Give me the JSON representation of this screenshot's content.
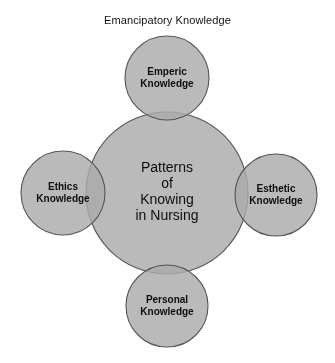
{
  "figure": {
    "caption": "Emancipatory Knowledge",
    "center": {
      "lines": [
        "Patterns",
        "of",
        "Knowing",
        "in Nursing"
      ],
      "text": "Patterns\nof\nKnowing\nin Nursing"
    },
    "nodes": [
      {
        "id": "emperic",
        "position": "top",
        "lines": [
          "Emperic",
          "Knowledge"
        ],
        "text": "Emperic\nKnowledge"
      },
      {
        "id": "ethics",
        "position": "left",
        "lines": [
          "Ethics",
          "Knowledge"
        ],
        "text": "Ethics\nKnowledge"
      },
      {
        "id": "esthetic",
        "position": "right",
        "lines": [
          "Esthetic",
          "Knowledge"
        ],
        "text": "Esthetic\nKnowledge"
      },
      {
        "id": "personal",
        "position": "bottom",
        "lines": [
          "Personal",
          "Knowledge"
        ],
        "text": "Personal\nKnowledge"
      }
    ]
  },
  "chart_data": {
    "type": "diagram",
    "subtype": "venn-overlap",
    "title": "Emancipatory Knowledge",
    "center_node": {
      "label": "Patterns of Knowing in Nursing",
      "cx": 167,
      "cy": 193,
      "r": 81
    },
    "satellite_nodes": [
      {
        "label": "Emperic Knowledge",
        "cx": 167,
        "cy": 78,
        "r": 42
      },
      {
        "label": "Ethics Knowledge",
        "cx": 63,
        "cy": 193,
        "r": 42
      },
      {
        "label": "Esthetic Knowledge",
        "cx": 276,
        "cy": 195,
        "r": 41
      },
      {
        "label": "Personal Knowledge",
        "cx": 167,
        "cy": 306,
        "r": 41
      }
    ],
    "colors": {
      "fill": "#ababab",
      "overlap": "#8a8a8a",
      "stroke": "#555555",
      "background": "#ffffff",
      "text": "#0d0d0d"
    }
  }
}
